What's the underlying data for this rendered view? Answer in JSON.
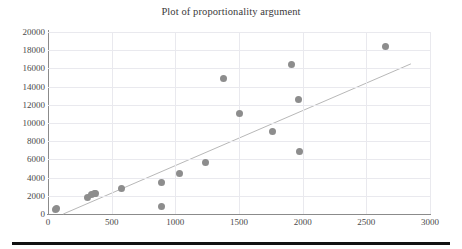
{
  "chart_data": {
    "type": "scatter",
    "title": "Plot of proportionality argument",
    "xlabel": "",
    "ylabel": "",
    "xlim": [
      0,
      3000
    ],
    "ylim": [
      0,
      20000
    ],
    "grid": true,
    "legend": null,
    "x_ticks": [
      0,
      500,
      1000,
      1500,
      2000,
      2500,
      3000
    ],
    "y_ticks": [
      0,
      2000,
      4000,
      6000,
      8000,
      10000,
      12000,
      14000,
      16000,
      18000,
      20000
    ],
    "x_tick_labels": [
      "0",
      "500",
      "1000",
      "1500",
      "2000",
      "2500",
      "3000"
    ],
    "y_tick_labels": [
      "0",
      "2000",
      "4000",
      "6000",
      "8000",
      "10000",
      "12000",
      "14000",
      "16000",
      "18000",
      "20000"
    ],
    "marker_color": "#8d8d8d",
    "line_color": "#b8b8b8",
    "series": [
      {
        "name": "data",
        "type": "scatter",
        "points": [
          [
            55,
            520
          ],
          [
            70,
            560
          ],
          [
            310,
            1800
          ],
          [
            340,
            2150
          ],
          [
            365,
            2250
          ],
          [
            375,
            2280
          ],
          [
            575,
            2850
          ],
          [
            890,
            3500
          ],
          [
            895,
            770
          ],
          [
            1030,
            4450
          ],
          [
            1240,
            5620
          ],
          [
            1375,
            14850
          ],
          [
            1500,
            11050
          ],
          [
            1760,
            9100
          ],
          [
            1915,
            16400
          ],
          [
            1970,
            12600
          ],
          [
            1975,
            6900
          ],
          [
            2650,
            18400
          ]
        ]
      },
      {
        "name": "proportionality trend line",
        "type": "line",
        "points": [
          [
            120,
            0
          ],
          [
            2850,
            16500
          ]
        ]
      }
    ]
  },
  "chart": {
    "title": "Plot of proportionality argument"
  }
}
